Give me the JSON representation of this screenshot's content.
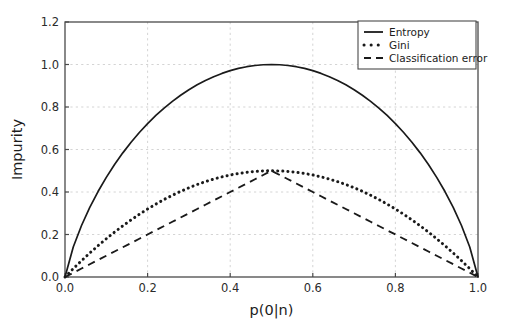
{
  "chart_data": {
    "type": "line",
    "title": "",
    "xlabel": "p(0|n)",
    "ylabel": "Impurity",
    "xlim": [
      0.0,
      1.0
    ],
    "ylim": [
      0.0,
      1.2
    ],
    "grid": true,
    "legend_position": "upper right",
    "xticks": [
      "0.0",
      "0.2",
      "0.4",
      "0.6",
      "0.8",
      "1.0"
    ],
    "xtick_values": [
      0.0,
      0.2,
      0.4,
      0.6,
      0.8,
      1.0
    ],
    "yticks": [
      "0.0",
      "0.2",
      "0.4",
      "0.6",
      "0.8",
      "1.0",
      "1.2"
    ],
    "ytick_values": [
      0.0,
      0.2,
      0.4,
      0.6,
      0.8,
      1.0,
      1.2
    ],
    "x": [
      0.0,
      0.02,
      0.04,
      0.06,
      0.08,
      0.1,
      0.12,
      0.14,
      0.16,
      0.18,
      0.2,
      0.22,
      0.24,
      0.26,
      0.28,
      0.3,
      0.32,
      0.34,
      0.36,
      0.38,
      0.4,
      0.42,
      0.44,
      0.46,
      0.48,
      0.5,
      0.52,
      0.54,
      0.56,
      0.58,
      0.6,
      0.62,
      0.64,
      0.66,
      0.68,
      0.7,
      0.72,
      0.74,
      0.76,
      0.78,
      0.8,
      0.82,
      0.84,
      0.86,
      0.88,
      0.9,
      0.92,
      0.94,
      0.96,
      0.98,
      1.0
    ],
    "series": [
      {
        "name": "Entropy",
        "style": "solid",
        "color": "#1a1a1a",
        "values": [
          0.0,
          0.1414,
          0.2423,
          0.3274,
          0.4022,
          0.469,
          0.5294,
          0.5842,
          0.6343,
          0.6801,
          0.7219,
          0.7602,
          0.795,
          0.8267,
          0.8555,
          0.8813,
          0.9044,
          0.9249,
          0.9427,
          0.958,
          0.971,
          0.9815,
          0.9896,
          0.9954,
          0.9988,
          1.0,
          0.9988,
          0.9954,
          0.9896,
          0.9815,
          0.971,
          0.958,
          0.9427,
          0.9249,
          0.9044,
          0.8813,
          0.8555,
          0.8267,
          0.795,
          0.7602,
          0.7219,
          0.6801,
          0.6343,
          0.5842,
          0.5294,
          0.469,
          0.4022,
          0.3274,
          0.2423,
          0.1414,
          0.0
        ]
      },
      {
        "name": "Gini",
        "style": "dotted",
        "color": "#1a1a1a",
        "values": [
          0.0,
          0.0392,
          0.0768,
          0.1128,
          0.1472,
          0.18,
          0.2112,
          0.2408,
          0.2688,
          0.2952,
          0.32,
          0.3432,
          0.3648,
          0.3848,
          0.4032,
          0.42,
          0.4352,
          0.4488,
          0.4608,
          0.4712,
          0.48,
          0.4872,
          0.4928,
          0.4968,
          0.4992,
          0.5,
          0.4992,
          0.4968,
          0.4928,
          0.4872,
          0.48,
          0.4712,
          0.4608,
          0.4488,
          0.4352,
          0.42,
          0.4032,
          0.3848,
          0.3648,
          0.3432,
          0.32,
          0.2952,
          0.2688,
          0.2408,
          0.2112,
          0.18,
          0.1472,
          0.1128,
          0.0768,
          0.0392,
          0.0
        ]
      },
      {
        "name": "Classification error",
        "style": "dashed",
        "color": "#1a1a1a",
        "values": [
          0.0,
          0.02,
          0.04,
          0.06,
          0.08,
          0.1,
          0.12,
          0.14,
          0.16,
          0.18,
          0.2,
          0.22,
          0.24,
          0.26,
          0.28,
          0.3,
          0.32,
          0.34,
          0.36,
          0.38,
          0.4,
          0.42,
          0.44,
          0.46,
          0.48,
          0.5,
          0.48,
          0.46,
          0.44,
          0.42,
          0.4,
          0.38,
          0.36,
          0.34,
          0.32,
          0.3,
          0.28,
          0.26,
          0.24,
          0.22,
          0.2,
          0.18,
          0.16,
          0.14,
          0.12,
          0.1,
          0.08,
          0.06,
          0.04,
          0.02,
          0.0
        ]
      }
    ],
    "legend_entries": [
      "Entropy",
      "Gini",
      "Classification error"
    ]
  },
  "figure": {
    "background_color": "#ffffff",
    "axes_color": "#4a4a4a",
    "grid_color": "#cfcfcf",
    "line_color": "#1a1a1a"
  }
}
